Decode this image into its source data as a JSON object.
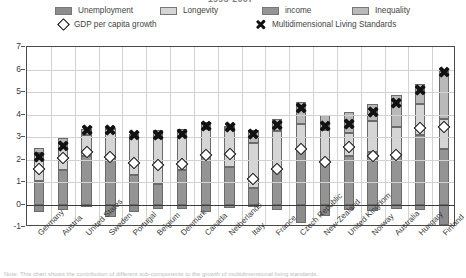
{
  "title": "1995-2007",
  "legend": {
    "items": [
      {
        "name": "unemployment",
        "label": "Unemployment",
        "color": "#8c8c8c",
        "marker": "swatch"
      },
      {
        "name": "longevity",
        "label": "Longevity",
        "color": "#d5d5d5",
        "marker": "swatch"
      },
      {
        "name": "income",
        "label": "income",
        "color": "#949494",
        "marker": "swatch"
      },
      {
        "name": "inequality",
        "label": "Inequality",
        "color": "#b9b9b9",
        "marker": "swatch"
      },
      {
        "name": "gdp-per-capita-growth",
        "label": "GDP per capita growth",
        "color": "#ffffff",
        "marker": "diamond"
      },
      {
        "name": "multidimensional-living-standards",
        "label": "Multidimensional Living Standards",
        "color": "#111111",
        "marker": "cross"
      }
    ]
  },
  "note": "Note: This chart shows the contribution of different sub-components to the growth of multidimensional living standards.",
  "chart_data": {
    "type": "bar",
    "stacked": true,
    "title": "1995-2007",
    "xlabel": "",
    "ylabel": "",
    "ylim": [
      -1,
      7
    ],
    "yticks": [
      -1,
      0,
      1,
      2,
      3,
      4,
      5,
      6,
      7
    ],
    "grid": true,
    "legend_position": "top",
    "categories": [
      "Germany",
      "Austria",
      "United States",
      "Sweden",
      "Portugal",
      "Belgium",
      "Denmark",
      "Canada",
      "Netherlands",
      "Italy",
      "France",
      "Czech Republic",
      "New-Zealand",
      "United Kingdom",
      "Norway",
      "Australia",
      "Hungary",
      "Finland"
    ],
    "series": [
      {
        "name": "income",
        "color": "#949494",
        "values": [
          1.05,
          1.55,
          2.15,
          2.15,
          1.3,
          0.9,
          1.55,
          2.2,
          1.65,
          0.75,
          1.5,
          2.5,
          1.85,
          2.15,
          2.35,
          2.2,
          3.1,
          2.45
        ]
      },
      {
        "name": "Longevity",
        "color": "#d5d5d5",
        "values": [
          1.25,
          1.15,
          0.95,
          1.2,
          1.75,
          2.05,
          1.45,
          1.15,
          1.75,
          2.0,
          1.75,
          1.1,
          1.45,
          1.05,
          1.35,
          1.25,
          1.35,
          1.35
        ]
      },
      {
        "name": "Inequality",
        "color": "#b9b9b9",
        "values": [
          0.2,
          0.25,
          0.25,
          0.05,
          0.1,
          0.35,
          0.35,
          0.3,
          0.1,
          0.55,
          0.55,
          0.95,
          0.7,
          0.9,
          0.75,
          1.4,
          0.9,
          2.15
        ]
      },
      {
        "name": "Unemployment",
        "color": "#8c8c8c",
        "values": [
          -0.35,
          -0.25,
          -0.1,
          -0.55,
          -0.35,
          -0.2,
          -0.2,
          -0.35,
          -0.15,
          -0.1,
          -0.25,
          -0.8,
          -0.5,
          -0.25,
          -0.3,
          -0.2,
          -0.25,
          -0.9
        ]
      }
    ],
    "markers": [
      {
        "name": "GDP per capita growth",
        "symbol": "diamond",
        "values": [
          1.6,
          2.05,
          2.35,
          2.1,
          1.85,
          1.75,
          1.8,
          2.2,
          2.25,
          1.15,
          1.6,
          2.45,
          1.9,
          2.55,
          2.15,
          2.2,
          3.4,
          3.45
        ]
      },
      {
        "name": "Multidimensional Living Standards",
        "symbol": "cross",
        "values": [
          2.1,
          2.6,
          3.3,
          3.3,
          3.1,
          3.1,
          3.15,
          3.5,
          3.45,
          3.15,
          3.55,
          4.3,
          3.5,
          3.6,
          4.1,
          4.5,
          5.1,
          5.9
        ]
      }
    ]
  }
}
